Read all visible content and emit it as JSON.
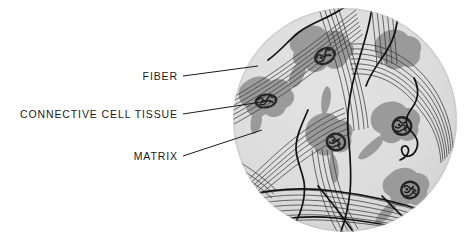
{
  "figure": {
    "background_color": "#ffffff",
    "circle": {
      "name": "microscope-field-circle",
      "center_x": 345,
      "center_y": 120,
      "radius": 112,
      "matrix_fill": "#d8d8d8",
      "matrix_fill_light": "#e2e2e2"
    },
    "colors": {
      "matrix": "#d8d8d8",
      "cell_body": "#9a9a9a",
      "nucleus": "#2b2b2b",
      "fiber": "#262626",
      "leader_line": "#1a1a1a",
      "text": "#1a1a1a"
    }
  },
  "labels": [
    {
      "id": "fiber",
      "text": "FIBER",
      "name": "label-fiber",
      "text_x": 178,
      "text_y": 80,
      "anchor": "end",
      "leader": {
        "x1": 183,
        "y1": 76,
        "x2": 258,
        "y2": 66
      }
    },
    {
      "id": "connective-cell-tissue",
      "text": "CONNECTIVE  CELL  TISSUE",
      "name": "label-connective-cell-tissue",
      "text_x": 178,
      "text_y": 118,
      "anchor": "end",
      "leader": {
        "x1": 183,
        "y1": 114,
        "x2": 268,
        "y2": 101
      }
    },
    {
      "id": "matrix",
      "text": "MATRIX",
      "name": "label-matrix",
      "text_x": 178,
      "text_y": 160,
      "anchor": "end",
      "leader": {
        "x1": 183,
        "y1": 156,
        "x2": 262,
        "y2": 130
      }
    }
  ],
  "cells": [
    {
      "id": "cell-top-center",
      "name": "connective-cell-top-center",
      "nucleus": true,
      "nucleus_cx": 325,
      "nucleus_cy": 56,
      "nucleus_rx": 11,
      "nucleus_ry": 8,
      "nucleus_rot": -28
    },
    {
      "id": "cell-left",
      "name": "connective-cell-left",
      "nucleus": true,
      "nucleus_cx": 266,
      "nucleus_cy": 101,
      "nucleus_rx": 11,
      "nucleus_ry": 7,
      "nucleus_rot": -8
    },
    {
      "id": "cell-center",
      "name": "connective-cell-center",
      "nucleus": true,
      "nucleus_cx": 336,
      "nucleus_cy": 142,
      "nucleus_rx": 10,
      "nucleus_ry": 9,
      "nucleus_rot": 12
    },
    {
      "id": "cell-right",
      "name": "connective-cell-right",
      "nucleus": true,
      "nucleus_cx": 402,
      "nucleus_cy": 126,
      "nucleus_rx": 10,
      "nucleus_ry": 10,
      "nucleus_rot": 5
    },
    {
      "id": "cell-bottom-right",
      "name": "connective-cell-bottom-right",
      "nucleus": true,
      "nucleus_cx": 410,
      "nucleus_cy": 190,
      "nucleus_rx": 10,
      "nucleus_ry": 9,
      "nucleus_rot": -5
    },
    {
      "id": "cell-upper-right",
      "name": "connective-cell-upper-right",
      "nucleus": false,
      "nucleus_cx": 0,
      "nucleus_cy": 0,
      "nucleus_rx": 0,
      "nucleus_ry": 0,
      "nucleus_rot": 0
    }
  ]
}
